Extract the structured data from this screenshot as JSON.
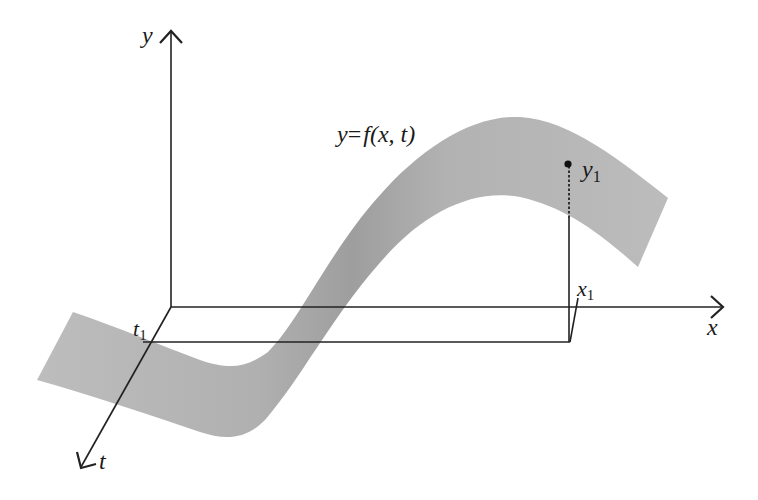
{
  "diagram": {
    "type": "3d-surface-sketch",
    "colors": {
      "axis": "#222222",
      "surface": "#b3b3b3",
      "surface_shadow": "#a0a0a0",
      "background": "#ffffff"
    },
    "axes": {
      "y": {
        "label": "y"
      },
      "x": {
        "label": "x"
      },
      "t": {
        "label": "t"
      }
    },
    "function_label": {
      "lhs": "y",
      "eq": "=",
      "rhs": "f(x, t)"
    },
    "markers": {
      "y1": {
        "base": "y",
        "sub": "1"
      },
      "x1": {
        "base": "x",
        "sub": "1"
      },
      "t1": {
        "base": "t",
        "sub": "1"
      }
    }
  }
}
